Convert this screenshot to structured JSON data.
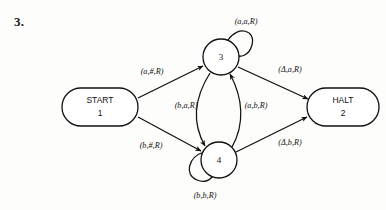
{
  "page": {
    "item_number": "3.",
    "background_color": "#fdfdfb",
    "ink_color": "#111111"
  },
  "diagram": {
    "type": "turing-machine-state-diagram",
    "nodes": [
      {
        "id": "start",
        "shape": "stadium",
        "line1": "START",
        "line2": "1",
        "cx": 104,
        "cy": 107
      },
      {
        "id": "halt",
        "shape": "stadium",
        "line1": "HALT",
        "line2": "2",
        "cx": 340,
        "cy": 107
      },
      {
        "id": "s3",
        "shape": "circle",
        "label": "3",
        "cx": 221,
        "cy": 57
      },
      {
        "id": "s4",
        "shape": "circle",
        "label": "4",
        "cx": 219,
        "cy": 160
      }
    ],
    "edges": [
      {
        "id": "e-start-3",
        "from": "start",
        "to": "s3",
        "label": "(a,#,R)",
        "lx": 152,
        "ly": 72
      },
      {
        "id": "e-start-4",
        "from": "start",
        "to": "s4",
        "label": "(b,#,R)",
        "lx": 151,
        "ly": 146
      },
      {
        "id": "e-3-4",
        "from": "s3",
        "to": "s4",
        "label": "(b,a,R)",
        "lx": 186,
        "ly": 106
      },
      {
        "id": "e-4-3",
        "from": "s4",
        "to": "s3",
        "label": "(a,b,R)",
        "lx": 254,
        "ly": 106
      },
      {
        "id": "e-3-halt",
        "from": "s3",
        "to": "halt",
        "label": "(Δ,a,R)",
        "lx": 288,
        "ly": 70
      },
      {
        "id": "e-4-halt",
        "from": "s4",
        "to": "halt",
        "label": "(Δ,b,R)",
        "lx": 288,
        "ly": 143
      },
      {
        "id": "e-3-loop",
        "from": "s3",
        "to": "s3",
        "label": "(a,a,R)",
        "lx": 246,
        "ly": 22
      },
      {
        "id": "e-4-loop",
        "from": "s4",
        "to": "s4",
        "label": "(b,b,R)",
        "lx": 205,
        "ly": 196
      }
    ]
  }
}
